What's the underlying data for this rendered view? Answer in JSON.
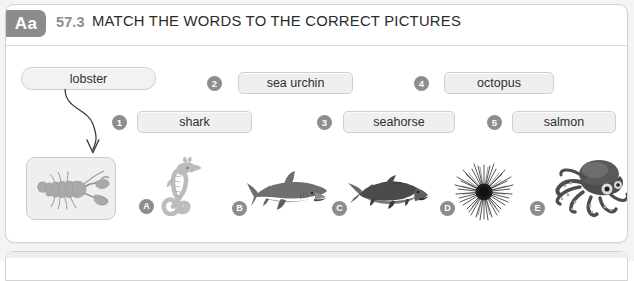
{
  "page": {
    "background_color": "#f4f4f4",
    "card_color": "#ffffff",
    "accent_gray": "#8c8c8c"
  },
  "header": {
    "badge_label": "Aa",
    "exercise_number": "57.3",
    "title": "MATCH THE WORDS TO THE CORRECT PICTURES"
  },
  "example": {
    "word": "lobster",
    "picture_name": "lobster-illustration"
  },
  "words": [
    {
      "number": "1",
      "label": "shark"
    },
    {
      "number": "2",
      "label": "sea urchin"
    },
    {
      "number": "3",
      "label": "seahorse"
    },
    {
      "number": "4",
      "label": "octopus"
    },
    {
      "number": "5",
      "label": "salmon"
    }
  ],
  "pictures": [
    {
      "letter": "A",
      "subject": "seahorse"
    },
    {
      "letter": "B",
      "subject": "shark"
    },
    {
      "letter": "C",
      "subject": "salmon"
    },
    {
      "letter": "D",
      "subject": "sea urchin"
    },
    {
      "letter": "E",
      "subject": "octopus"
    }
  ]
}
